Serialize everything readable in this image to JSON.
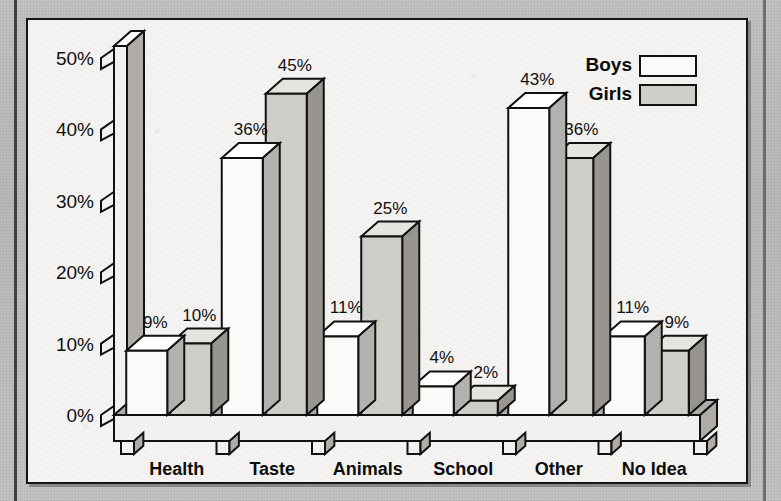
{
  "chart_data": {
    "type": "bar",
    "title": "",
    "subtitle": "",
    "xlabel": "",
    "ylabel": "",
    "ylim": [
      0,
      50
    ],
    "grid": false,
    "style": "3d-grouped-column",
    "legend_position": "top-right",
    "categories": [
      "Health",
      "Taste",
      "Animals Killed",
      "School",
      "Other",
      "No Idea"
    ],
    "category_lines": [
      [
        "Health"
      ],
      [
        "Taste"
      ],
      [
        "Animals",
        "Killed"
      ],
      [
        "School"
      ],
      [
        "Other"
      ],
      [
        "No Idea"
      ]
    ],
    "ytick_labels": [
      "0%",
      "10%",
      "20%",
      "30%",
      "40%",
      "50%"
    ],
    "ytick_values": [
      0,
      10,
      20,
      30,
      40,
      50
    ],
    "series": [
      {
        "name": "Boys",
        "swatch": "white",
        "color": "#fbfaf8",
        "values": [
          9,
          36,
          11,
          4,
          43,
          11
        ],
        "labels": [
          "9%",
          "36%",
          "11%",
          "4%",
          "43%",
          "11%"
        ]
      },
      {
        "name": "Girls",
        "swatch": "gray",
        "color": "#cfcdc8",
        "values": [
          10,
          45,
          25,
          2,
          36,
          9
        ],
        "labels": [
          "10%",
          "45%",
          "25%",
          "2%",
          "36%",
          "9%"
        ]
      }
    ]
  },
  "legend": {
    "entries": [
      {
        "label": "Boys",
        "swatch_color": "#fbfaf8"
      },
      {
        "label": "Girls",
        "swatch_color": "#cfcdc8"
      }
    ]
  },
  "colors": {
    "ink": "#111111",
    "panel_background": "#f4f3f1",
    "page_background": "#bab9b7",
    "boys_fill": "#fbfaf8",
    "girls_fill": "#cfcdc8",
    "boys_side": "#b3b1ad",
    "girls_side": "#98958f"
  }
}
